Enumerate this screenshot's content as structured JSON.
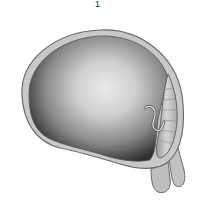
{
  "figure": {
    "label": "1",
    "colors": {
      "membrane_fill": "#c8c8c8",
      "membrane_stroke": "#6a6a6a",
      "cavity_light": "#e4e4e4",
      "cavity_dark": "#3a3a3a",
      "lobe_fill": "#bdbdbd"
    }
  }
}
